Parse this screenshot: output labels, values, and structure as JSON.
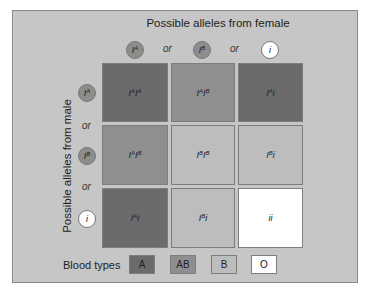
{
  "diagram": {
    "top_title": "Possible alleles from female",
    "side_title": "Possible alleles from male",
    "or_label": "or",
    "colors": {
      "panel": "#c6c6c6",
      "A": "#6b6b6b",
      "AB": "#8f8f8f",
      "B": "#bdbdbd",
      "O": "#ffffff"
    },
    "female_alleles": [
      {
        "base": "I",
        "sup": "A",
        "style": "dark"
      },
      {
        "base": "I",
        "sup": "B",
        "style": "dark"
      },
      {
        "base": "i",
        "sup": "",
        "style": "white"
      }
    ],
    "male_alleles": [
      {
        "base": "I",
        "sup": "A",
        "style": "dark"
      },
      {
        "base": "I",
        "sup": "B",
        "style": "dark"
      },
      {
        "base": "i",
        "sup": "",
        "style": "white"
      }
    ],
    "grid": [
      [
        {
          "genotype": "IAIA",
          "parts": [
            [
              "I",
              "A"
            ],
            [
              "I",
              "A"
            ]
          ],
          "type": "A"
        },
        {
          "genotype": "IAIB",
          "parts": [
            [
              "I",
              "A"
            ],
            [
              "I",
              "B"
            ]
          ],
          "type": "AB"
        },
        {
          "genotype": "IAi",
          "parts": [
            [
              "I",
              "A"
            ],
            [
              "i",
              ""
            ]
          ],
          "type": "A"
        }
      ],
      [
        {
          "genotype": "IAIB",
          "parts": [
            [
              "I",
              "A"
            ],
            [
              "I",
              "B"
            ]
          ],
          "type": "AB"
        },
        {
          "genotype": "IBIB",
          "parts": [
            [
              "I",
              "B"
            ],
            [
              "I",
              "B"
            ]
          ],
          "type": "B"
        },
        {
          "genotype": "IBi",
          "parts": [
            [
              "I",
              "B"
            ],
            [
              "i",
              ""
            ]
          ],
          "type": "B"
        }
      ],
      [
        {
          "genotype": "IAi",
          "parts": [
            [
              "I",
              "A"
            ],
            [
              "i",
              ""
            ]
          ],
          "type": "A"
        },
        {
          "genotype": "IBi",
          "parts": [
            [
              "I",
              "B"
            ],
            [
              "i",
              ""
            ]
          ],
          "type": "B"
        },
        {
          "genotype": "ii",
          "parts": [
            [
              "i",
              ""
            ],
            [
              "i",
              ""
            ]
          ],
          "type": "O"
        }
      ]
    ],
    "legend": {
      "label": "Blood types",
      "items": [
        {
          "label": "A",
          "type": "A"
        },
        {
          "label": "AB",
          "type": "AB"
        },
        {
          "label": "B",
          "type": "B"
        },
        {
          "label": "O",
          "type": "O"
        }
      ]
    }
  }
}
